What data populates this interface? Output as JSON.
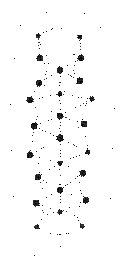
{
  "figure": {
    "name": "network-graph-figure",
    "width": 123,
    "height": 271,
    "background_color": "#ffffff",
    "ink_color": "#1a1a1a",
    "edge_color": "#555555",
    "render_style": "dithered-halftone-lowres"
  },
  "chart_data": {
    "type": "scatter",
    "title": "",
    "subtitle": "",
    "xlabel": "",
    "ylabel": "",
    "grid": false,
    "legend": false,
    "xlim": [
      0,
      123
    ],
    "ylim": [
      0,
      271
    ],
    "node_style": {
      "shape": "circle",
      "color": "#141414",
      "radius_small": 1.6,
      "radius_medium": 2.4,
      "radius_large": 3.2
    },
    "edge_style": {
      "color": "#4a4a4a",
      "dash": "1 2",
      "width": 0.7,
      "curved": true
    },
    "nodes": [
      {
        "id": "n01",
        "x": 38,
        "y": 36,
        "size": "medium"
      },
      {
        "id": "n02",
        "x": 80,
        "y": 37,
        "size": "medium"
      },
      {
        "id": "n03",
        "x": 40,
        "y": 58,
        "size": "large"
      },
      {
        "id": "n04",
        "x": 81,
        "y": 58,
        "size": "large"
      },
      {
        "id": "n05",
        "x": 60,
        "y": 70,
        "size": "large"
      },
      {
        "id": "n06",
        "x": 39,
        "y": 83,
        "size": "large"
      },
      {
        "id": "n07",
        "x": 80,
        "y": 81,
        "size": "large"
      },
      {
        "id": "n08",
        "x": 60,
        "y": 94,
        "size": "medium"
      },
      {
        "id": "n09",
        "x": 30,
        "y": 100,
        "size": "large"
      },
      {
        "id": "n10",
        "x": 92,
        "y": 99,
        "size": "medium"
      },
      {
        "id": "n11",
        "x": 60,
        "y": 116,
        "size": "large"
      },
      {
        "id": "n12",
        "x": 34,
        "y": 126,
        "size": "large"
      },
      {
        "id": "n13",
        "x": 84,
        "y": 124,
        "size": "large"
      },
      {
        "id": "n14",
        "x": 60,
        "y": 138,
        "size": "large"
      },
      {
        "id": "n15",
        "x": 30,
        "y": 155,
        "size": "large"
      },
      {
        "id": "n16",
        "x": 88,
        "y": 152,
        "size": "medium"
      },
      {
        "id": "n17",
        "x": 60,
        "y": 163,
        "size": "medium"
      },
      {
        "id": "n18",
        "x": 38,
        "y": 177,
        "size": "large"
      },
      {
        "id": "n19",
        "x": 83,
        "y": 173,
        "size": "large"
      },
      {
        "id": "n20",
        "x": 60,
        "y": 190,
        "size": "large"
      },
      {
        "id": "n21",
        "x": 36,
        "y": 203,
        "size": "large"
      },
      {
        "id": "n22",
        "x": 86,
        "y": 200,
        "size": "large"
      },
      {
        "id": "n23",
        "x": 60,
        "y": 212,
        "size": "medium"
      },
      {
        "id": "n24",
        "x": 37,
        "y": 227,
        "size": "medium"
      },
      {
        "id": "n25",
        "x": 82,
        "y": 226,
        "size": "medium"
      }
    ],
    "edges": [
      {
        "source": "n01",
        "target": "n02",
        "curve": -16
      },
      {
        "source": "n01",
        "target": "n03",
        "curve": 0
      },
      {
        "source": "n02",
        "target": "n04",
        "curve": 0
      },
      {
        "source": "n01",
        "target": "n05",
        "curve": 8
      },
      {
        "source": "n02",
        "target": "n05",
        "curve": -8
      },
      {
        "source": "n03",
        "target": "n05",
        "curve": 0
      },
      {
        "source": "n04",
        "target": "n05",
        "curve": 0
      },
      {
        "source": "n03",
        "target": "n06",
        "curve": -14
      },
      {
        "source": "n04",
        "target": "n07",
        "curve": 14
      },
      {
        "source": "n05",
        "target": "n06",
        "curve": 0
      },
      {
        "source": "n05",
        "target": "n07",
        "curve": 0
      },
      {
        "source": "n05",
        "target": "n08",
        "curve": 0
      },
      {
        "source": "n06",
        "target": "n08",
        "curve": 0
      },
      {
        "source": "n07",
        "target": "n08",
        "curve": 0
      },
      {
        "source": "n06",
        "target": "n09",
        "curve": 0
      },
      {
        "source": "n07",
        "target": "n10",
        "curve": 0
      },
      {
        "source": "n08",
        "target": "n09",
        "curve": 0
      },
      {
        "source": "n08",
        "target": "n10",
        "curve": 0
      },
      {
        "source": "n08",
        "target": "n11",
        "curve": 0
      },
      {
        "source": "n09",
        "target": "n11",
        "curve": 0
      },
      {
        "source": "n10",
        "target": "n11",
        "curve": 0
      },
      {
        "source": "n09",
        "target": "n12",
        "curve": -10
      },
      {
        "source": "n10",
        "target": "n13",
        "curve": 10
      },
      {
        "source": "n11",
        "target": "n12",
        "curve": 0
      },
      {
        "source": "n11",
        "target": "n13",
        "curve": 0
      },
      {
        "source": "n11",
        "target": "n14",
        "curve": 0
      },
      {
        "source": "n12",
        "target": "n14",
        "curve": 0
      },
      {
        "source": "n13",
        "target": "n14",
        "curve": 0
      },
      {
        "source": "n12",
        "target": "n15",
        "curve": 0
      },
      {
        "source": "n13",
        "target": "n16",
        "curve": 0
      },
      {
        "source": "n14",
        "target": "n15",
        "curve": 0
      },
      {
        "source": "n14",
        "target": "n16",
        "curve": 0
      },
      {
        "source": "n14",
        "target": "n17",
        "curve": 0
      },
      {
        "source": "n15",
        "target": "n17",
        "curve": 0
      },
      {
        "source": "n16",
        "target": "n17",
        "curve": 0
      },
      {
        "source": "n15",
        "target": "n18",
        "curve": -10
      },
      {
        "source": "n16",
        "target": "n19",
        "curve": 10
      },
      {
        "source": "n17",
        "target": "n18",
        "curve": 0
      },
      {
        "source": "n17",
        "target": "n19",
        "curve": 0
      },
      {
        "source": "n17",
        "target": "n20",
        "curve": 0
      },
      {
        "source": "n18",
        "target": "n20",
        "curve": 0
      },
      {
        "source": "n19",
        "target": "n20",
        "curve": 0
      },
      {
        "source": "n18",
        "target": "n21",
        "curve": -10
      },
      {
        "source": "n19",
        "target": "n22",
        "curve": 10
      },
      {
        "source": "n20",
        "target": "n21",
        "curve": 0
      },
      {
        "source": "n20",
        "target": "n22",
        "curve": 0
      },
      {
        "source": "n20",
        "target": "n23",
        "curve": 0
      },
      {
        "source": "n21",
        "target": "n23",
        "curve": 0
      },
      {
        "source": "n22",
        "target": "n23",
        "curve": 0
      },
      {
        "source": "n21",
        "target": "n24",
        "curve": -14
      },
      {
        "source": "n22",
        "target": "n25",
        "curve": 14
      },
      {
        "source": "n23",
        "target": "n24",
        "curve": 10
      },
      {
        "source": "n23",
        "target": "n25",
        "curve": -10
      },
      {
        "source": "n24",
        "target": "n25",
        "curve": 16
      }
    ],
    "speckles": [
      {
        "x": 46,
        "y": 12,
        "size": 1
      },
      {
        "x": 84,
        "y": 13,
        "size": 1
      },
      {
        "x": 20,
        "y": 25,
        "size": 1
      },
      {
        "x": 60,
        "y": 24,
        "size": 1
      },
      {
        "x": 100,
        "y": 27,
        "size": 1
      },
      {
        "x": 14,
        "y": 58,
        "size": 1
      },
      {
        "x": 110,
        "y": 60,
        "size": 1
      },
      {
        "x": 10,
        "y": 104,
        "size": 1
      },
      {
        "x": 114,
        "y": 108,
        "size": 1
      },
      {
        "x": 11,
        "y": 150,
        "size": 1
      },
      {
        "x": 112,
        "y": 148,
        "size": 1
      },
      {
        "x": 13,
        "y": 196,
        "size": 1
      },
      {
        "x": 110,
        "y": 198,
        "size": 1
      },
      {
        "x": 17,
        "y": 243,
        "size": 1
      },
      {
        "x": 60,
        "y": 246,
        "size": 1
      },
      {
        "x": 34,
        "y": 255,
        "size": 1
      }
    ]
  }
}
